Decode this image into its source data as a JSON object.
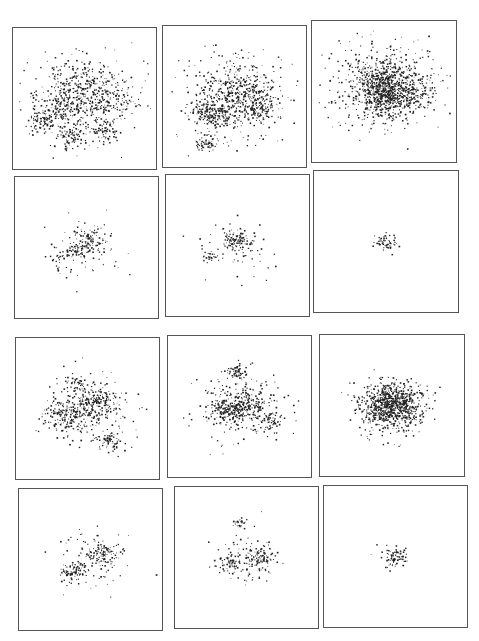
{
  "figure": {
    "caption_fragment": "",
    "panels": [
      {
        "id": "r1c1",
        "x": 12,
        "y": 27,
        "w": 145,
        "h": 143,
        "spread": 0.42,
        "dots": 900,
        "clumps": [
          [
            0.5,
            0.45,
            0.12,
            0.8
          ],
          [
            0.35,
            0.55,
            0.06,
            0.4
          ],
          [
            0.2,
            0.66,
            0.04,
            0.3
          ],
          [
            0.4,
            0.78,
            0.04,
            0.3
          ],
          [
            0.62,
            0.72,
            0.04,
            0.3
          ],
          [
            0.68,
            0.5,
            0.08,
            0.4
          ]
        ]
      },
      {
        "id": "r1c2",
        "x": 162,
        "y": 25,
        "w": 145,
        "h": 143,
        "spread": 0.42,
        "dots": 900,
        "clumps": [
          [
            0.55,
            0.48,
            0.1,
            1.0
          ],
          [
            0.3,
            0.6,
            0.05,
            0.4
          ],
          [
            0.38,
            0.65,
            0.04,
            0.3
          ],
          [
            0.65,
            0.6,
            0.05,
            0.3
          ],
          [
            0.3,
            0.83,
            0.03,
            0.2
          ]
        ]
      },
      {
        "id": "r1c3",
        "x": 311,
        "y": 20,
        "w": 146,
        "h": 143,
        "spread": 0.2,
        "dots": 1200,
        "clumps": [
          [
            0.5,
            0.45,
            0.16,
            1.0
          ],
          [
            0.6,
            0.48,
            0.1,
            0.6
          ]
        ]
      },
      {
        "id": "r2c1",
        "x": 14,
        "y": 176,
        "w": 145,
        "h": 143,
        "spread": 0.28,
        "dots": 220,
        "clumps": [
          [
            0.52,
            0.45,
            0.05,
            0.9
          ],
          [
            0.4,
            0.52,
            0.03,
            0.3
          ],
          [
            0.3,
            0.6,
            0.03,
            0.2
          ]
        ]
      },
      {
        "id": "r2c2",
        "x": 165,
        "y": 174,
        "w": 145,
        "h": 143,
        "spread": 0.25,
        "dots": 180,
        "clumps": [
          [
            0.5,
            0.47,
            0.04,
            0.9
          ],
          [
            0.3,
            0.58,
            0.02,
            0.2
          ]
        ]
      },
      {
        "id": "r2c3",
        "x": 313,
        "y": 170,
        "w": 146,
        "h": 143,
        "spread": 0.02,
        "dots": 60,
        "clumps": [
          [
            0.49,
            0.5,
            0.035,
            1.0
          ]
        ]
      },
      {
        "id": "r3c1",
        "x": 15,
        "y": 337,
        "w": 145,
        "h": 143,
        "spread": 0.32,
        "dots": 600,
        "clumps": [
          [
            0.55,
            0.45,
            0.06,
            0.9
          ],
          [
            0.35,
            0.55,
            0.06,
            0.9
          ],
          [
            0.65,
            0.72,
            0.04,
            0.4
          ],
          [
            0.42,
            0.32,
            0.03,
            0.2
          ]
        ]
      },
      {
        "id": "r3c2",
        "x": 167,
        "y": 335,
        "w": 145,
        "h": 143,
        "spread": 0.32,
        "dots": 600,
        "clumps": [
          [
            0.55,
            0.5,
            0.06,
            0.8
          ],
          [
            0.4,
            0.52,
            0.05,
            0.8
          ],
          [
            0.7,
            0.6,
            0.04,
            0.4
          ],
          [
            0.48,
            0.25,
            0.03,
            0.3
          ]
        ]
      },
      {
        "id": "r3c3",
        "x": 319,
        "y": 334,
        "w": 146,
        "h": 143,
        "spread": 0.18,
        "dots": 900,
        "clumps": [
          [
            0.5,
            0.5,
            0.1,
            1.0
          ]
        ]
      },
      {
        "id": "r4c1",
        "x": 18,
        "y": 488,
        "w": 145,
        "h": 143,
        "spread": 0.26,
        "dots": 260,
        "clumps": [
          [
            0.58,
            0.45,
            0.05,
            0.8
          ],
          [
            0.37,
            0.58,
            0.04,
            0.8
          ]
        ]
      },
      {
        "id": "r4c2",
        "x": 174,
        "y": 486,
        "w": 145,
        "h": 143,
        "spread": 0.25,
        "dots": 240,
        "clumps": [
          [
            0.58,
            0.5,
            0.04,
            0.8
          ],
          [
            0.38,
            0.54,
            0.04,
            0.6
          ],
          [
            0.45,
            0.25,
            0.02,
            0.2
          ]
        ]
      },
      {
        "id": "r4c3",
        "x": 323,
        "y": 485,
        "w": 145,
        "h": 143,
        "spread": 0.02,
        "dots": 80,
        "clumps": [
          [
            0.5,
            0.5,
            0.04,
            1.0
          ]
        ]
      }
    ]
  }
}
